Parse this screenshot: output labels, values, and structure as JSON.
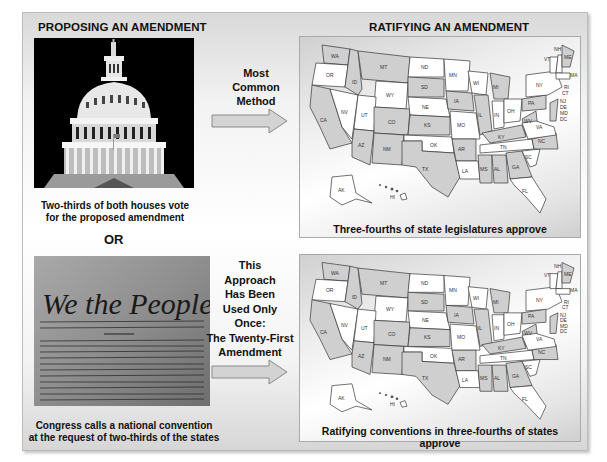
{
  "left_column": {
    "heading": "PROPOSING AN AMENDMENT",
    "method_1": {
      "image": "us-capitol-dome-photo",
      "caption_line1": "Two-thirds of both houses vote",
      "caption_line2": "for the proposed amendment"
    },
    "separator": "OR",
    "method_2": {
      "image": "we-the-people-constitution-photo",
      "image_text": "We the People",
      "caption_line1": "Congress calls a national convention",
      "caption_line2": "at the request of two-thirds of the states"
    }
  },
  "middle": {
    "arrow_1": {
      "label_lines": [
        "Most",
        "Common",
        "Method"
      ],
      "icon": "right-arrow-icon"
    },
    "arrow_2": {
      "label_lines": [
        "This",
        "Approach",
        "Has Been",
        "Used Only",
        "Once:",
        "The Twenty-First",
        "Amendment"
      ],
      "icon": "right-arrow-icon"
    }
  },
  "right_column": {
    "heading": "RATIFYING AN AMENDMENT",
    "map_1": {
      "caption": "Three-fourths of state legislatures approve"
    },
    "map_2": {
      "caption": "Ratifying conventions in three-fourths of states approve"
    },
    "state_labels": [
      "WA",
      "OR",
      "CA",
      "ID",
      "NV",
      "MT",
      "WY",
      "UT",
      "AZ",
      "CO",
      "NM",
      "ND",
      "SD",
      "NE",
      "KS",
      "OK",
      "TX",
      "MN",
      "IA",
      "MO",
      "AR",
      "LA",
      "WI",
      "IL",
      "MI",
      "IN",
      "OH",
      "KY",
      "TN",
      "MS",
      "AL",
      "GA",
      "FL",
      "SC",
      "NC",
      "VA",
      "WV",
      "PA",
      "NY",
      "VT",
      "NH",
      "ME",
      "MA",
      "RI",
      "CT",
      "NJ",
      "DE",
      "MD",
      "DC",
      "AK",
      "HI"
    ]
  },
  "colors": {
    "shaded_state": "#cfcfcf",
    "white_state": "#ffffff",
    "arrow_fill": "#d3d3d3",
    "arrow_stroke": "#8a8a8a"
  }
}
